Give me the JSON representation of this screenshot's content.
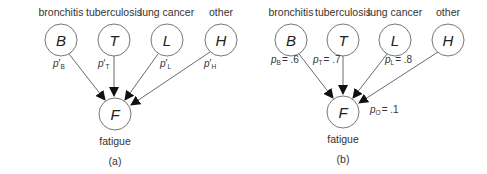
{
  "panels": [
    {
      "id": "a",
      "caption": "(a)",
      "parents": [
        {
          "symbol": "B",
          "label": "bronchitis",
          "prob_base": "p",
          "prob_sub": "B",
          "prob_prime": "′",
          "prob_value": ""
        },
        {
          "symbol": "T",
          "label": "tuberculosis",
          "prob_base": "p",
          "prob_sub": "T",
          "prob_prime": "′",
          "prob_value": ""
        },
        {
          "symbol": "L",
          "label": "lung cancer",
          "prob_base": "p",
          "prob_sub": "L",
          "prob_prime": "′",
          "prob_value": ""
        },
        {
          "symbol": "H",
          "label": "other",
          "prob_base": "p",
          "prob_sub": "H",
          "prob_prime": "′",
          "prob_value": ""
        }
      ],
      "child": {
        "symbol": "F",
        "label": "fatigue"
      }
    },
    {
      "id": "b",
      "caption": "(b)",
      "parents": [
        {
          "symbol": "B",
          "label": "bronchitis",
          "prob_base": "p",
          "prob_sub": "B",
          "prob_value": "= .6"
        },
        {
          "symbol": "T",
          "label": "tuberculosis",
          "prob_base": "p",
          "prob_sub": "T",
          "prob_value": "= .7"
        },
        {
          "symbol": "L",
          "label": "lung cancer",
          "prob_base": "p",
          "prob_sub": "L",
          "prob_value": "= .8"
        },
        {
          "symbol": "H",
          "label": "other",
          "prob_base": "",
          "prob_sub": "",
          "prob_value": ""
        }
      ],
      "child": {
        "symbol": "F",
        "label": "fatigue"
      },
      "leak": {
        "prob_base": "p",
        "prob_sub": "O",
        "prob_value": "= .1"
      }
    }
  ]
}
